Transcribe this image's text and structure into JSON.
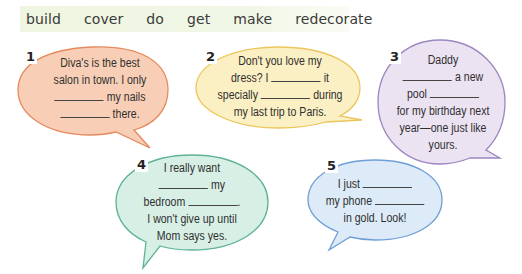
{
  "word_bank": [
    "build",
    "cover",
    "do",
    "get",
    "make",
    "redecorate"
  ],
  "colors": {
    "word_bank_bg": "#eef5e0",
    "bubble1_fill": "#f8cfb6",
    "bubble1_stroke": "#e58a5e",
    "bubble2_fill": "#fbefc4",
    "bubble2_stroke": "#ecc65c",
    "bubble3_fill": "#ece3f2",
    "bubble3_stroke": "#9b86c0",
    "bubble4_fill": "#d8efe6",
    "bubble4_stroke": "#5fb395",
    "bubble5_fill": "#dcebf7",
    "bubble5_stroke": "#6f9fd6"
  },
  "bubbles": [
    {
      "number": "1",
      "lines": [
        "Diva's is the best",
        "salon in town. I only",
        "__ my nails",
        "__ there."
      ]
    },
    {
      "number": "2",
      "lines": [
        "Don't you love my",
        "dress? I __ it",
        "specially __ during",
        "my last trip to Paris."
      ]
    },
    {
      "number": "3",
      "lines": [
        "Daddy",
        "__ a new",
        "pool __",
        "for my birthday next",
        "year—one just like",
        "yours."
      ]
    },
    {
      "number": "4",
      "lines": [
        "I really want",
        "__ my",
        "bedroom __.",
        "I won't give up until",
        "Mom says yes."
      ]
    },
    {
      "number": "5",
      "lines": [
        "I just __",
        "my phone __",
        "in gold. Look!"
      ]
    }
  ],
  "text": {
    "b1": {
      "l1": "Diva's is the best",
      "l2": "salon in town. I only",
      "l3": " my nails",
      "l4": " there."
    },
    "b2": {
      "l1": "Don't you love my",
      "l2a": "dress? I ",
      "l2b": " it",
      "l3a": "specially ",
      "l3b": " during",
      "l4": "my last trip to Paris."
    },
    "b3": {
      "l1": "Daddy",
      "l2": " a new",
      "l3a": "pool ",
      "l4": "for my birthday next",
      "l5": "year—one just like",
      "l6": "yours."
    },
    "b4": {
      "l1": "I really want",
      "l2": " my",
      "l3a": "bedroom ",
      "l3b": ".",
      "l4": "I won't give up until",
      "l5": "Mom says yes."
    },
    "b5": {
      "l1": "I just ",
      "l2": "my phone ",
      "l3": "in gold. Look!"
    }
  }
}
